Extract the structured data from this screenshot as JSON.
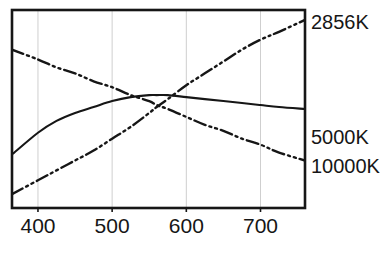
{
  "figure": {
    "background_color": "#ffffff",
    "ink_color": "#161616",
    "grid_color": "#cfcfcf"
  },
  "axes": {
    "frame": {
      "left": 12,
      "top": 10,
      "right": 305,
      "bottom": 208
    },
    "x": {
      "label": "",
      "unit": "nm",
      "min": 365,
      "max": 760,
      "ticks": [
        400,
        500,
        600,
        700
      ],
      "tick_labels": [
        "400",
        "500",
        "600",
        "700"
      ],
      "grid": true
    },
    "y": {
      "label": "",
      "min": 0,
      "max": 100,
      "ticks": [],
      "tick_labels": [],
      "grid": false
    }
  },
  "series_labels": [
    {
      "id": "label-2856k",
      "text": "2856K",
      "y_px": 22
    },
    {
      "id": "label-5000k",
      "text": "5000K",
      "y_px": 137
    },
    {
      "id": "label-10000k",
      "text": "10000K",
      "y_px": 166
    }
  ],
  "caption": {
    "text": ""
  },
  "chart_data": {
    "type": "line",
    "title": "",
    "subtitle": "",
    "xlabel": "Wavelength (nm)",
    "ylabel": "Relative spectral power",
    "xlim": [
      365,
      760
    ],
    "ylim": [
      0,
      100
    ],
    "xticks": [
      400,
      500,
      600,
      700
    ],
    "yticks": [],
    "grid": "vertical-only",
    "legend": "inline-right-end-labels",
    "x": [
      365,
      400,
      425,
      450,
      475,
      500,
      525,
      550,
      560,
      575,
      600,
      625,
      650,
      675,
      700,
      725,
      760
    ],
    "series": [
      {
        "name": "2856K",
        "linestyle": "dash-dot-dot",
        "color": "#161616",
        "description": "Tungsten incandescent: rises steadily with wavelength",
        "values": [
          7,
          14,
          19,
          24,
          29,
          35,
          41,
          48,
          51,
          55,
          62,
          68,
          74,
          80,
          85,
          89,
          95
        ]
      },
      {
        "name": "5000K",
        "linestyle": "solid",
        "color": "#161616",
        "description": "Daylight 5000K: broad gentle arch peaking near 555 nm",
        "values": [
          27,
          38,
          44,
          48,
          51,
          54,
          56,
          57,
          57,
          57,
          56,
          55,
          54,
          53,
          52,
          51,
          50
        ]
      },
      {
        "name": "10000K",
        "linestyle": "dash-dot-dot",
        "color": "#161616",
        "description": "Cool 10000K: falls steadily with wavelength",
        "values": [
          80,
          75,
          71,
          68,
          64,
          61,
          57,
          54,
          52,
          50,
          46,
          42,
          39,
          35,
          32,
          28,
          24
        ]
      }
    ]
  }
}
